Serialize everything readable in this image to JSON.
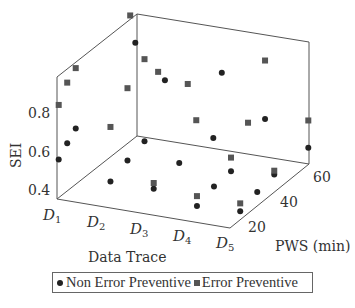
{
  "chart_data": {
    "type": "scatter3d",
    "title": "",
    "xlabel": "Data Trace",
    "ylabel": "PWS (min)",
    "zlabel": "SEI",
    "x_categories": [
      "D1",
      "D2",
      "D3",
      "D4",
      "D5"
    ],
    "y_ticks": [
      20,
      40,
      60
    ],
    "z_ticks": [
      0.4,
      0.6,
      0.8
    ],
    "ylim": [
      14,
      61
    ],
    "zlim": [
      0.355,
      0.98
    ],
    "grid": false,
    "legend_position": "bottom",
    "series": [
      {
        "name": "Non Error Preventive",
        "marker": "circle",
        "color": "#222222",
        "points": [
          {
            "x": "D1",
            "y": 15,
            "z": 0.55
          },
          {
            "x": "D1",
            "y": 20,
            "z": 0.6
          },
          {
            "x": "D1",
            "y": 25,
            "z": 0.64
          },
          {
            "x": "D2",
            "y": 20,
            "z": 0.44
          },
          {
            "x": "D2",
            "y": 30,
            "z": 0.48
          },
          {
            "x": "D2",
            "y": 40,
            "z": 0.51
          },
          {
            "x": "D3",
            "y": 20,
            "z": 0.44
          },
          {
            "x": "D3",
            "y": 35,
            "z": 0.47
          },
          {
            "x": "D3",
            "y": 55,
            "z": 0.46
          },
          {
            "x": "D4",
            "y": 20,
            "z": 0.39
          },
          {
            "x": "D4",
            "y": 30,
            "z": 0.42
          },
          {
            "x": "D4",
            "y": 40,
            "z": 0.43
          },
          {
            "x": "D5",
            "y": 20,
            "z": 0.4
          },
          {
            "x": "D5",
            "y": 30,
            "z": 0.43
          },
          {
            "x": "D5",
            "y": 40,
            "z": 0.45
          },
          {
            "x": "D1",
            "y": 60,
            "z": 0.84
          },
          {
            "x": "D2",
            "y": 52,
            "z": 0.74
          },
          {
            "x": "D3",
            "y": 60,
            "z": 0.76
          },
          {
            "x": "D4",
            "y": 60,
            "z": 0.56
          },
          {
            "x": "D5",
            "y": 60,
            "z": 0.45
          }
        ]
      },
      {
        "name": "Error Preventive",
        "marker": "square",
        "color": "#555555",
        "points": [
          {
            "x": "D1",
            "y": 15,
            "z": 0.83
          },
          {
            "x": "D1",
            "y": 20,
            "z": 0.91
          },
          {
            "x": "D1",
            "y": 25,
            "z": 0.95
          },
          {
            "x": "D2",
            "y": 20,
            "z": 0.72
          },
          {
            "x": "D2",
            "y": 30,
            "z": 0.85
          },
          {
            "x": "D2",
            "y": 40,
            "z": 0.93
          },
          {
            "x": "D1",
            "y": 57,
            "z": 1.0
          },
          {
            "x": "D1",
            "y": 61,
            "z": 1.09
          },
          {
            "x": "D2",
            "y": 48,
            "z": 0.81
          },
          {
            "x": "D3",
            "y": 40,
            "z": 0.84
          },
          {
            "x": "D3",
            "y": 60,
            "z": 1.26
          },
          {
            "x": "D3",
            "y": 20,
            "z": 0.47
          },
          {
            "x": "D4",
            "y": 20,
            "z": 0.44
          },
          {
            "x": "D4",
            "y": 40,
            "z": 0.5
          },
          {
            "x": "D4",
            "y": 60,
            "z": 0.86
          },
          {
            "x": "D5",
            "y": 20,
            "z": 0.44
          },
          {
            "x": "D5",
            "y": 40,
            "z": 0.47
          },
          {
            "x": "D5",
            "y": 60,
            "z": 0.59
          },
          {
            "x": "D3",
            "y": 45,
            "z": 0.62
          },
          {
            "x": "D4",
            "y": 50,
            "z": 0.61
          }
        ]
      }
    ]
  },
  "axes": {
    "zlabel": "SEI",
    "xlabel": "Data Trace",
    "ylabel": "PWS (min)",
    "z_tick_labels": [
      "0.4",
      "0.6",
      "0.8"
    ],
    "y_tick_labels": [
      "20",
      "40",
      "60"
    ],
    "x_tick_labels": [
      "D",
      "D",
      "D",
      "D",
      "D"
    ],
    "x_tick_subs": [
      "1",
      "2",
      "3",
      "4",
      "5"
    ]
  },
  "legend": {
    "items": [
      {
        "label": "Non Error Preventive",
        "marker": "circle"
      },
      {
        "label": "Error Preventive",
        "marker": "square"
      }
    ]
  }
}
